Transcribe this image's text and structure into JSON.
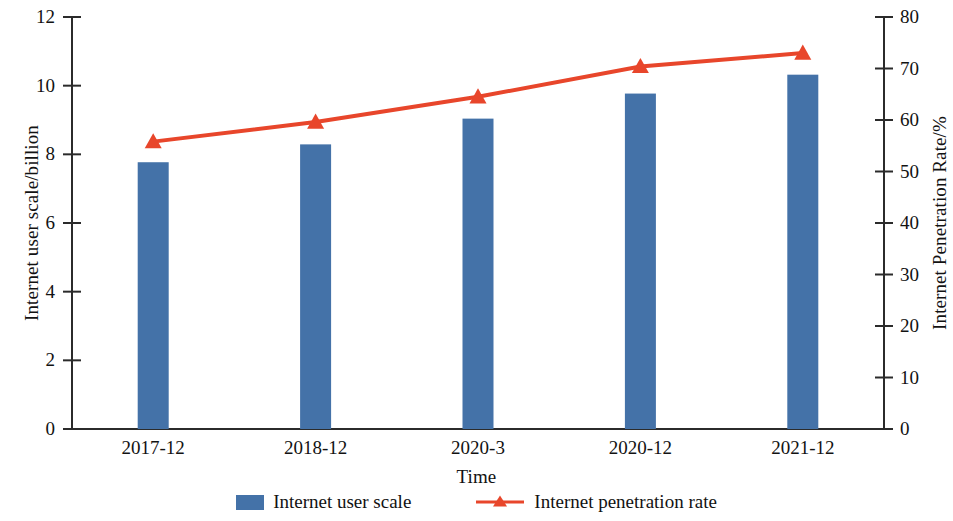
{
  "chart_data": {
    "type": "bar",
    "title": "",
    "subtitle": "",
    "xlabel": "Time",
    "ylabel": "Internet user scale/billion",
    "y2label": "Internet Penetration Rate/%",
    "categories": [
      "2017-12",
      "2018-12",
      "2020-3",
      "2020-12",
      "2021-12"
    ],
    "ylim": [
      0,
      12
    ],
    "y2lim": [
      0,
      80
    ],
    "yticks": [
      "0",
      "2",
      "4",
      "6",
      "8",
      "10",
      "12"
    ],
    "ytick_values": [
      0,
      2,
      4,
      6,
      8,
      10,
      12
    ],
    "y2ticks": [
      "0",
      "10",
      "20",
      "30",
      "40",
      "50",
      "60",
      "70",
      "80"
    ],
    "y2tick_values": [
      0,
      10,
      20,
      30,
      40,
      50,
      60,
      70,
      80
    ],
    "grid": false,
    "legend_position": "bottom",
    "series": [
      {
        "name": "Internet user scale",
        "type": "bar",
        "axis": "left",
        "color": "#4472a8",
        "values": [
          7.77,
          8.29,
          9.04,
          9.77,
          10.32
        ]
      },
      {
        "name": "Internet penetration rate",
        "type": "line",
        "axis": "right",
        "color": "#e8462b",
        "marker": "triangle",
        "values": [
          55.8,
          59.6,
          64.5,
          70.4,
          73.0
        ]
      }
    ]
  },
  "legend": {
    "items": [
      {
        "label": "Internet user scale",
        "marker": "square-swatch",
        "color": "#4472a8"
      },
      {
        "label": "Internet penetration rate",
        "marker": "line-with-triangle",
        "color": "#e8462b"
      }
    ]
  }
}
